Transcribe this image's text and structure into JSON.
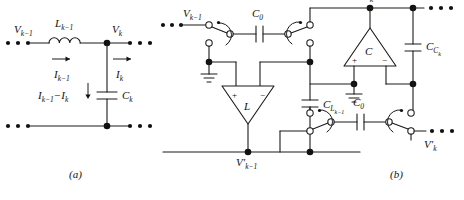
{
  "figure": {
    "panels": [
      {
        "id": "a",
        "caption": "(a)",
        "title": "LC ladder section",
        "labels": {
          "v_in": "V",
          "v_in_sub": "k−1",
          "inductor": "L",
          "inductor_sub": "k−1",
          "current_in": "I",
          "current_in_sub": "k−1",
          "v_out": "V",
          "v_out_sub": "k",
          "current_out": "I",
          "current_out_sub": "k",
          "branch_current": "I",
          "branch_current_sub": "k−1",
          "branch_current_2": "−I",
          "branch_current_2_sub": "k",
          "capacitor": "C",
          "capacitor_sub": "k"
        },
        "components": [
          {
            "name": "inductor",
            "type": "inductor",
            "label": "L_{k-1}"
          },
          {
            "name": "capacitor",
            "type": "capacitor",
            "label": "C_k"
          }
        ],
        "nodes": [
          "V_{k-1}",
          "V_k"
        ],
        "currents": [
          "I_{k-1}",
          "I_k",
          "I_{k-1}-I_k"
        ]
      },
      {
        "id": "b",
        "caption": "(b)",
        "title": "Switched-capacitor equivalent",
        "labels": {
          "v_in": "V",
          "v_in_sub": "k−1",
          "cap_top": "C",
          "cap_top_sub": "0",
          "v_top_right": "V",
          "v_top_right_sub": "k",
          "opamp_right": "C",
          "opamp_right_plus": "+",
          "opamp_right_minus": "−",
          "cap_right": "C",
          "cap_right_sub": "C",
          "cap_right_subsub": "k",
          "opamp_left": "L",
          "opamp_left_plus": "+",
          "opamp_left_minus": "−",
          "cap_mid": "C",
          "cap_mid_sub": "L",
          "cap_mid_subsub": "k−1",
          "cap_bottom": "C",
          "cap_bottom_sub": "0",
          "v_bottom": "V",
          "v_bottom_prime": "′",
          "v_bottom_sub": "k−1",
          "v_out_right": "V",
          "v_out_right_prime": "′",
          "v_out_right_sub": "k"
        },
        "components": [
          {
            "name": "switched-cap-top",
            "type": "capacitor",
            "label": "C_0"
          },
          {
            "name": "switched-cap-bottom",
            "type": "capacitor",
            "label": "C_0"
          },
          {
            "name": "opamp-inductor",
            "type": "opamp",
            "label": "L"
          },
          {
            "name": "opamp-capacitor",
            "type": "opamp",
            "label": "C"
          },
          {
            "name": "cap-l",
            "type": "capacitor",
            "label": "C_{L_{k-1}}"
          },
          {
            "name": "cap-c",
            "type": "capacitor",
            "label": "C_{C_k}"
          }
        ],
        "nodes": [
          "V_{k-1}",
          "V_k",
          "V'_{k-1}",
          "V'_k"
        ],
        "ground_count": 2,
        "switch_count": 4
      }
    ],
    "ellipsis": "• • •",
    "colors": {
      "wire": "#1a1a1a",
      "text": "#111111",
      "background": "#ffffff",
      "node_fill": "#111111",
      "terminal_fill": "#ffffff"
    }
  }
}
